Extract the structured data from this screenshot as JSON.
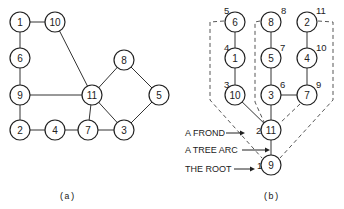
{
  "figure_a": {
    "caption": "(a)",
    "nodes": [
      {
        "id": "1",
        "x": 20,
        "y": 22
      },
      {
        "id": "10",
        "x": 55,
        "y": 22
      },
      {
        "id": "6",
        "x": 20,
        "y": 58
      },
      {
        "id": "9",
        "x": 20,
        "y": 95
      },
      {
        "id": "11",
        "x": 92,
        "y": 95
      },
      {
        "id": "8",
        "x": 124,
        "y": 60
      },
      {
        "id": "5",
        "x": 159,
        "y": 95
      },
      {
        "id": "2",
        "x": 20,
        "y": 130
      },
      {
        "id": "4",
        "x": 55,
        "y": 130
      },
      {
        "id": "7",
        "x": 88,
        "y": 130
      },
      {
        "id": "3",
        "x": 124,
        "y": 130
      }
    ],
    "edges": [
      [
        "1",
        "10"
      ],
      [
        "1",
        "6"
      ],
      [
        "6",
        "9"
      ],
      [
        "9",
        "2"
      ],
      [
        "2",
        "4"
      ],
      [
        "4",
        "7"
      ],
      [
        "7",
        "3"
      ],
      [
        "9",
        "11"
      ],
      [
        "10",
        "11"
      ],
      [
        "11",
        "7"
      ],
      [
        "11",
        "8"
      ],
      [
        "11",
        "3"
      ],
      [
        "8",
        "5"
      ],
      [
        "5",
        "3"
      ]
    ]
  },
  "figure_b": {
    "caption": "(b)",
    "nodes": [
      {
        "id": "6",
        "x": 235,
        "y": 22,
        "num": "5",
        "nx": 224,
        "ny": 14
      },
      {
        "id": "8",
        "x": 271,
        "y": 22,
        "num": "8",
        "nx": 281,
        "ny": 14
      },
      {
        "id": "2",
        "x": 307,
        "y": 22,
        "num": "11",
        "nx": 316,
        "ny": 14
      },
      {
        "id": "1",
        "x": 235,
        "y": 58,
        "num": "4",
        "nx": 224,
        "ny": 51
      },
      {
        "id": "5",
        "x": 271,
        "y": 58,
        "num": "7",
        "nx": 280,
        "ny": 51
      },
      {
        "id": "4",
        "x": 307,
        "y": 58,
        "num": "10",
        "nx": 316,
        "ny": 51
      },
      {
        "id": "10",
        "x": 235,
        "y": 95,
        "num": "3",
        "nx": 224,
        "ny": 88
      },
      {
        "id": "3",
        "x": 271,
        "y": 95,
        "num": "6",
        "nx": 280,
        "ny": 88
      },
      {
        "id": "7",
        "x": 307,
        "y": 95,
        "num": "9",
        "nx": 316,
        "ny": 88
      },
      {
        "id": "11",
        "x": 271,
        "y": 130,
        "num": "2",
        "nx": 256,
        "ny": 134
      },
      {
        "id": "9",
        "x": 271,
        "y": 165,
        "num": "1",
        "nx": 257,
        "ny": 169
      }
    ],
    "tree_arcs": [
      [
        "6",
        "1"
      ],
      [
        "1",
        "10"
      ],
      [
        "10",
        "11"
      ],
      [
        "8",
        "5"
      ],
      [
        "5",
        "3"
      ],
      [
        "3",
        "11"
      ],
      [
        "2",
        "4"
      ],
      [
        "4",
        "7"
      ],
      [
        "7",
        "3"
      ],
      [
        "11",
        "9"
      ]
    ],
    "labels": [
      {
        "text": "A FROND",
        "x": 185,
        "y": 133
      },
      {
        "text": "A TREE ARC",
        "x": 185,
        "y": 150
      },
      {
        "text": "THE ROOT",
        "x": 185,
        "y": 169
      }
    ]
  }
}
